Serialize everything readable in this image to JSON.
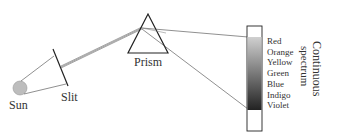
{
  "labels": {
    "sun": "Sun",
    "slit": "Slit",
    "prism": "Prism",
    "spectrum_title_line1": "Continuous",
    "spectrum_title_line2": "spectrum"
  },
  "spectrum_colors": [
    "Red",
    "Orange",
    "Yellow",
    "Green",
    "Blue",
    "Indigo",
    "Violet"
  ],
  "colors": {
    "line": "#333333",
    "sun_fill": "#bdbdbd",
    "gradient_top": "#c8c8c8",
    "gradient_bottom": "#2a2a2a"
  }
}
